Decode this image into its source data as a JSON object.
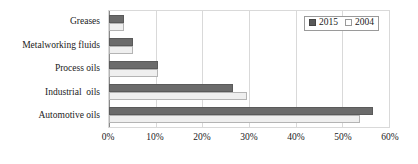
{
  "chart_data": {
    "type": "bar",
    "orientation": "horizontal",
    "title": "",
    "subtitle": "",
    "xlabel": "",
    "ylabel": "",
    "xlim": [
      0,
      60
    ],
    "ylim": null,
    "grid": true,
    "grid_axis": "x",
    "legend_position": "top-right",
    "categories": [
      "Automotive oils",
      "Industrial  oils",
      "Process oils",
      "Metalworking fluids",
      "Greases"
    ],
    "series": [
      {
        "name": "2015",
        "color": "#6b6b6b",
        "values": [
          56.5,
          26.5,
          10.5,
          5.1,
          3.3
        ]
      },
      {
        "name": "2004",
        "color": "#efefef",
        "values": [
          53.7,
          29.5,
          10.6,
          5.2,
          3.3
        ]
      }
    ],
    "x_ticks": [
      {
        "value": 0,
        "label": "0%"
      },
      {
        "value": 10,
        "label": "10%"
      },
      {
        "value": 20,
        "label": "20%"
      },
      {
        "value": 30,
        "label": "30%"
      },
      {
        "value": 40,
        "label": "40%"
      },
      {
        "value": 50,
        "label": "50%"
      },
      {
        "value": 60,
        "label": "60%"
      }
    ],
    "annotations": []
  },
  "legend": {
    "items": [
      {
        "label": "2015",
        "swatch": "filled-dark-square-icon"
      },
      {
        "label": "2004",
        "swatch": "outlined-light-square-icon"
      }
    ]
  },
  "colors": {
    "series_2015": "#6b6b6b",
    "series_2004": "#efefef",
    "grid": "#d9d9d9",
    "axis": "#8a8a8a",
    "text": "#1b1b1b",
    "background": "#ffffff"
  }
}
